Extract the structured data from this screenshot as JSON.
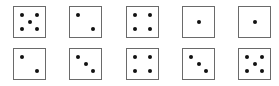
{
  "diagram": {
    "title": "",
    "layout": {
      "columns_x": [
        13,
        69,
        126,
        182,
        238
      ],
      "rows_y": [
        6,
        48
      ],
      "die_size": 32
    },
    "rows": [
      {
        "dice": [
          {
            "value": 5
          },
          {
            "value": 2
          },
          {
            "value": 4
          },
          {
            "value": 1
          },
          {
            "value": 1
          }
        ]
      },
      {
        "dice": [
          {
            "value": 2
          },
          {
            "value": 3
          },
          {
            "value": 4
          },
          {
            "value": 3
          },
          {
            "value": 5
          }
        ]
      }
    ],
    "colors": {
      "border": "#6a6a6a",
      "pip": "#111111",
      "background": "#ffffff"
    }
  }
}
